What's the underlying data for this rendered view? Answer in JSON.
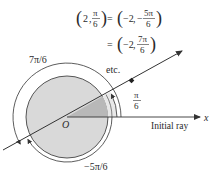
{
  "equations": {
    "line1": {
      "lhs_r": "2",
      "lhs_theta_num": "π",
      "lhs_theta_den": "6",
      "eq": "=",
      "rhs_r": "−2",
      "rhs_sign": "−",
      "rhs_theta_num": "5π",
      "rhs_theta_den": "6"
    },
    "line2": {
      "eq": "=",
      "rhs_r": "−2",
      "rhs_theta_num": "7π",
      "rhs_theta_den": "6"
    },
    "etc": "etc."
  },
  "labels": {
    "origin": "O",
    "x_axis": "x",
    "initial_ray": "Initial ray",
    "angle_pi6_num": "π",
    "angle_pi6_den": "6",
    "angle_7pi6": "7π/6",
    "angle_neg5pi6": "−5π/6"
  },
  "colors": {
    "ink": "#333333",
    "disk_fill": "#d9d9d9",
    "sector_fill": "#b8b8b8",
    "angle_band_fill": "#e6e6e6"
  }
}
